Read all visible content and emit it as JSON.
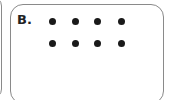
{
  "card": {
    "label": "B.",
    "dot_rows": 2,
    "dots_per_row": 4,
    "dot_color": "#1a1a1a"
  }
}
